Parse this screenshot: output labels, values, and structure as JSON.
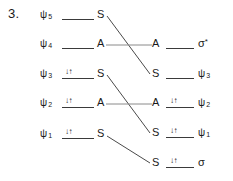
{
  "figure": {
    "item_number": "3.",
    "kind": "orbital-correlation-diagram",
    "line_color": "#3a3a3a",
    "text_color": "#1a1a1a",
    "electron_pair_glyph": "↓↑",
    "empty_glyph": ""
  },
  "left_column": {
    "rows": [
      {
        "orbital": "ψ",
        "sub": "5",
        "symmetry": "S",
        "electrons": "",
        "occupied": false
      },
      {
        "orbital": "ψ",
        "sub": "4",
        "symmetry": "A",
        "electrons": "",
        "occupied": false
      },
      {
        "orbital": "ψ",
        "sub": "3",
        "symmetry": "S",
        "electrons": "↓↑",
        "occupied": true
      },
      {
        "orbital": "ψ",
        "sub": "2",
        "symmetry": "A",
        "electrons": "↓↑",
        "occupied": true
      },
      {
        "orbital": "ψ",
        "sub": "1",
        "symmetry": "S",
        "electrons": "↓↑",
        "occupied": true
      }
    ]
  },
  "right_column": {
    "rows": [
      {
        "symmetry": "A",
        "electrons": "",
        "orbital": "σ",
        "star": "*",
        "sub": "",
        "occupied": false
      },
      {
        "symmetry": "S",
        "electrons": "",
        "orbital": "ψ",
        "star": "",
        "sub": "3",
        "occupied": false
      },
      {
        "symmetry": "A",
        "electrons": "↓↑",
        "orbital": "ψ",
        "star": "",
        "sub": "2",
        "occupied": true
      },
      {
        "symmetry": "S",
        "electrons": "↓↑",
        "orbital": "ψ",
        "star": "",
        "sub": "1",
        "occupied": true
      },
      {
        "symmetry": "S",
        "electrons": "↓↑",
        "orbital": "σ",
        "star": "",
        "sub": "",
        "occupied": true
      }
    ]
  },
  "correlations": [
    {
      "from": "left-row-1-S",
      "to": "right-row-2-S",
      "type": "diagonal-down"
    },
    {
      "from": "left-row-2-A",
      "to": "right-row-1-A",
      "type": "horizontal"
    },
    {
      "from": "left-row-3-S",
      "to": "right-row-4-S",
      "type": "diagonal-down"
    },
    {
      "from": "left-row-4-A",
      "to": "right-row-3-A",
      "type": "horizontal"
    },
    {
      "from": "left-row-5-S",
      "to": "right-row-5-S",
      "type": "diagonal-down"
    }
  ]
}
